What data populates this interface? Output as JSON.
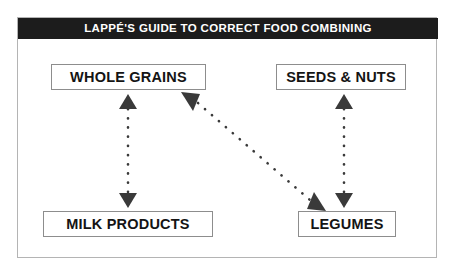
{
  "diagram": {
    "title": "LAPPÉ'S GUIDE TO CORRECT FOOD COMBINING",
    "type": "food-combining-chart",
    "colors": {
      "banner_background": "#1c1c1c",
      "banner_text": "#ffffff",
      "box_border": "#8d8d8d",
      "box_text": "#141414",
      "frame_border": "#b4b4b4",
      "connector": "#3a3a3a",
      "page_background": "#ffffff"
    },
    "nodes": [
      {
        "id": "whole-grains",
        "label": "WHOLE GRAINS",
        "position": "top-left"
      },
      {
        "id": "seeds-nuts",
        "label": "SEEDS & NUTS",
        "position": "top-right"
      },
      {
        "id": "milk-products",
        "label": "MILK PRODUCTS",
        "position": "bottom-left"
      },
      {
        "id": "legumes",
        "label": "LEGUMES",
        "position": "bottom-right"
      }
    ],
    "connectors": [
      {
        "id": "grains-milk",
        "from": "whole-grains",
        "to": "milk-products",
        "style": "dotted",
        "arrowheads": "both",
        "orientation": "vertical"
      },
      {
        "id": "seeds-legumes",
        "from": "seeds-nuts",
        "to": "legumes",
        "style": "dotted",
        "arrowheads": "both",
        "orientation": "vertical"
      },
      {
        "id": "grains-legumes",
        "from": "whole-grains",
        "to": "legumes",
        "style": "dotted",
        "arrowheads": "both",
        "orientation": "diagonal"
      }
    ]
  }
}
